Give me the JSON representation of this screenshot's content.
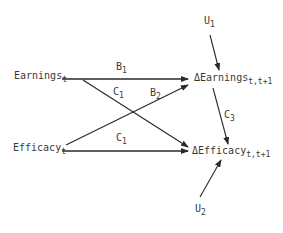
{
  "diagram": {
    "type": "path-diagram",
    "nodes": {
      "earnings_t": {
        "main": "Earnings",
        "sub": "t"
      },
      "efficacy_t": {
        "main": "Efficacy",
        "sub": "t"
      },
      "delta_earnings": {
        "main": "ΔEarnings",
        "sub": "t,t+1"
      },
      "delta_efficacy": {
        "main": "ΔEfficacy",
        "sub": "t,t+1"
      },
      "u1": {
        "main": "U",
        "sub": "1"
      },
      "u2": {
        "main": "U",
        "sub": "2"
      }
    },
    "edge_labels": {
      "b1": {
        "main": "B",
        "sub": "1"
      },
      "c1_upper": {
        "main": "C",
        "sub": "1"
      },
      "b2": {
        "main": "B",
        "sub": "2"
      },
      "c1_lower": {
        "main": "C",
        "sub": "1"
      },
      "c3": {
        "main": "C",
        "sub": "3"
      }
    },
    "edges": [
      {
        "from": "Earnings_t",
        "to": "ΔEarnings_t,t+1",
        "label": "B1"
      },
      {
        "from": "Earnings_t",
        "to": "ΔEfficacy_t,t+1",
        "label": "C1"
      },
      {
        "from": "Efficacy_t",
        "to": "ΔEarnings_t,t+1",
        "label": "B2"
      },
      {
        "from": "Efficacy_t",
        "to": "ΔEfficacy_t,t+1",
        "label": "C1"
      },
      {
        "from": "U1",
        "to": "ΔEarnings_t,t+1",
        "label": ""
      },
      {
        "from": "ΔEarnings_t,t+1",
        "to": "ΔEfficacy_t,t+1",
        "label": "C3"
      },
      {
        "from": "U2",
        "to": "ΔEfficacy_t,t+1",
        "label": ""
      }
    ],
    "colors": {
      "line": "#2a2a2a",
      "text": "#3a3a3a",
      "background": "#ffffff"
    }
  }
}
